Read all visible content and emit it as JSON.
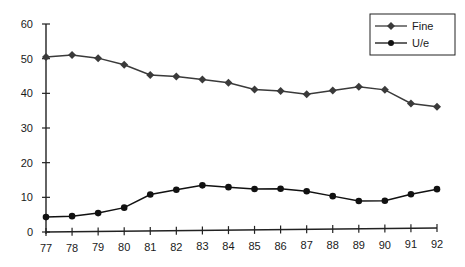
{
  "chart_data": {
    "type": "line",
    "title": "",
    "xlabel": "",
    "ylabel": "",
    "categories": [
      "77",
      "78",
      "79",
      "80",
      "81",
      "82",
      "83",
      "84",
      "85",
      "86",
      "87",
      "88",
      "89",
      "90",
      "91",
      "92"
    ],
    "series": [
      {
        "name": "Fine",
        "marker": "diamond",
        "color": "#3a3a3a",
        "values": [
          50.5,
          51,
          50,
          48,
          45,
          44.5,
          43.5,
          42.5,
          40.5,
          40,
          39,
          40,
          41,
          40,
          36,
          35
        ]
      },
      {
        "name": "U/e",
        "marker": "circle",
        "color": "#111111",
        "values": [
          4.3,
          4.5,
          5.3,
          6.8,
          10.5,
          11.8,
          13,
          12.4,
          11.8,
          11.8,
          11,
          9.5,
          8,
          8,
          9.8,
          11.2
        ]
      }
    ],
    "yticks": [
      0,
      10,
      20,
      30,
      40,
      50,
      60
    ],
    "ylim": [
      0,
      60
    ],
    "grid": false,
    "legend_position": "top-right"
  },
  "legend": {
    "items": [
      {
        "label": "Fine"
      },
      {
        "label": "U/e"
      }
    ]
  }
}
